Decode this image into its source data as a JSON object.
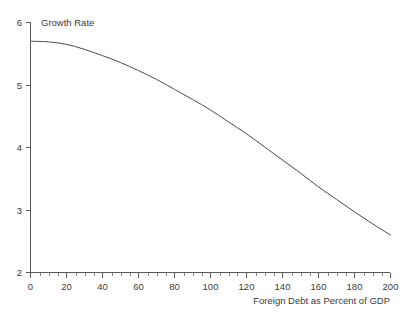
{
  "chart_data": {
    "type": "line",
    "title": "",
    "xlabel": "Foreign Debt as Percent of GDP",
    "ylabel": "Growth Rate",
    "ylabel_position": "top-inline",
    "xlabel_position": "bottom-right",
    "xlim": [
      0,
      200
    ],
    "ylim": [
      2,
      6
    ],
    "grid": false,
    "legend": null,
    "x_major_ticks": [
      0,
      20,
      40,
      60,
      80,
      100,
      120,
      140,
      160,
      180,
      200
    ],
    "x_tick_labels": [
      "0",
      "20",
      "40",
      "60",
      "80",
      "100",
      "120",
      "140",
      "160",
      "180",
      "200"
    ],
    "x_minor_tick_interval": 5,
    "y_major_ticks": [
      2,
      3,
      4,
      5,
      6
    ],
    "y_tick_labels": [
      "2",
      "3",
      "4",
      "5",
      "6"
    ],
    "y_minor_ticks": [],
    "series": [
      {
        "name": "Growth Rate",
        "x": [
          0,
          10,
          20,
          30,
          40,
          50,
          60,
          70,
          80,
          90,
          100,
          110,
          120,
          130,
          140,
          150,
          160,
          170,
          180,
          190,
          200
        ],
        "values": [
          5.7,
          5.69,
          5.65,
          5.57,
          5.47,
          5.36,
          5.23,
          5.09,
          4.93,
          4.77,
          4.6,
          4.41,
          4.22,
          4.01,
          3.8,
          3.59,
          3.37,
          3.17,
          2.97,
          2.78,
          2.6
        ]
      }
    ],
    "annotations": [],
    "curve_color": "#4a4a4a",
    "axis_color": "#5a5a5a",
    "background_color": "#ffffff"
  },
  "axes": {
    "y_axis_caption": "Growth Rate",
    "x_axis_caption": "Foreign Debt as Percent of GDP"
  }
}
